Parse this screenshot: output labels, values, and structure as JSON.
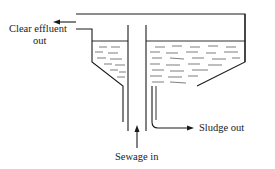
{
  "diagram": {
    "labels": {
      "effluent_line1": "Clear effluent",
      "effluent_line2": "out",
      "sludge": "Sludge out",
      "sewage": "Sewage in"
    },
    "colors": {
      "stroke": "#1a1a1a",
      "background": "#ffffff"
    }
  }
}
